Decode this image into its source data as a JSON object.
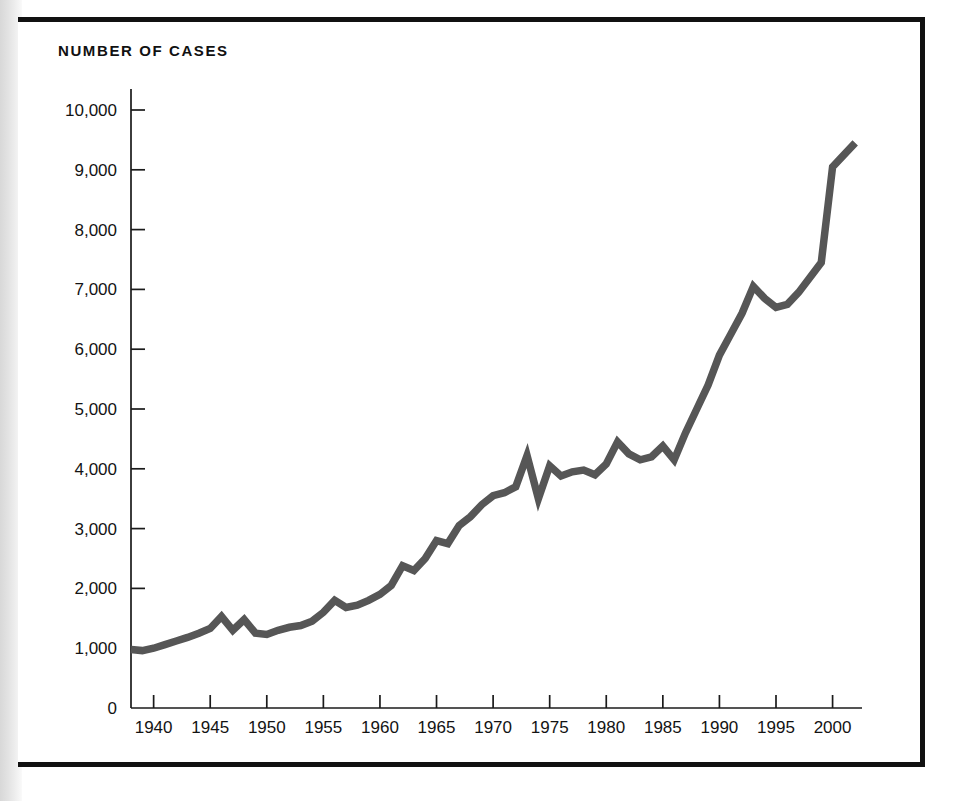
{
  "figure": {
    "title": "NUMBER OF CASES",
    "frame_color": "#111111",
    "background_color": "#ffffff",
    "gutter_shadow_color": "#dcdcdc"
  },
  "chart_data": {
    "type": "line",
    "title": "NUMBER OF CASES",
    "xlabel": "",
    "ylabel": "NUMBER OF CASES",
    "series_color": "#565656",
    "grid": false,
    "legend": null,
    "xlim": [
      1938,
      2002
    ],
    "ylim": [
      0,
      10000
    ],
    "ytick_labels": [
      "0",
      "1,000",
      "2,000",
      "3,000",
      "4,000",
      "5,000",
      "6,000",
      "7,000",
      "8,000",
      "9,000",
      "10,000"
    ],
    "ytick_values": [
      0,
      1000,
      2000,
      3000,
      4000,
      5000,
      6000,
      7000,
      8000,
      9000,
      10000
    ],
    "xtick_labels": [
      "1940",
      "1945",
      "1950",
      "1955",
      "1960",
      "1965",
      "1970",
      "1975",
      "1980",
      "1985",
      "1990",
      "1995",
      "2000"
    ],
    "xtick_values": [
      1940,
      1945,
      1950,
      1955,
      1960,
      1965,
      1970,
      1975,
      1980,
      1985,
      1990,
      1995,
      2000
    ],
    "x": [
      1938,
      1939,
      1940,
      1941,
      1942,
      1943,
      1944,
      1945,
      1946,
      1947,
      1948,
      1949,
      1950,
      1951,
      1952,
      1953,
      1954,
      1955,
      1956,
      1957,
      1958,
      1959,
      1960,
      1961,
      1962,
      1963,
      1964,
      1965,
      1966,
      1967,
      1968,
      1969,
      1970,
      1971,
      1972,
      1973,
      1974,
      1975,
      1976,
      1977,
      1978,
      1979,
      1980,
      1981,
      1982,
      1983,
      1984,
      1985,
      1986,
      1987,
      1988,
      1989,
      1990,
      1991,
      1992,
      1993,
      1994,
      1995,
      1996,
      1997,
      1998,
      1999,
      2000,
      2001,
      2002
    ],
    "values": [
      980,
      960,
      1000,
      1060,
      1120,
      1180,
      1250,
      1330,
      1530,
      1300,
      1480,
      1250,
      1230,
      1300,
      1350,
      1380,
      1450,
      1600,
      1800,
      1680,
      1720,
      1800,
      1900,
      2050,
      2380,
      2300,
      2500,
      2800,
      2750,
      3050,
      3200,
      3400,
      3550,
      3600,
      3700,
      4220,
      3500,
      4050,
      3880,
      3950,
      3980,
      3900,
      4080,
      4450,
      4250,
      4150,
      4200,
      4380,
      4150,
      4600,
      5000,
      5400,
      5900,
      6250,
      6600,
      7050,
      6850,
      6700,
      6750,
      6950,
      7200,
      7450,
      9050,
      9250,
      9450
    ],
    "series_name": "Number of cases"
  }
}
